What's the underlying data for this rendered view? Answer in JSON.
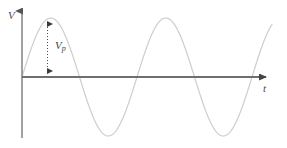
{
  "figure": {
    "background_color": "#ffffff",
    "width": 287,
    "height": 148
  },
  "axes": {
    "y_axis": {
      "label": "V",
      "name": "voltage",
      "color": "#808080",
      "origin_x": 22,
      "top_y": 8,
      "bottom_y": 138,
      "arrow": "up"
    },
    "x_axis": {
      "label": "t",
      "name": "time",
      "color": "#808080",
      "origin_y": 77,
      "left_x": 22,
      "right_x": 272,
      "arrow": "right"
    }
  },
  "annotation": {
    "label_main": "V",
    "label_sub": "p",
    "full_label": "Vp",
    "meaning": "peak voltage",
    "line_style": "dotted",
    "line_color": "#555555",
    "arrow_heads": "both",
    "x": 47.5,
    "y_top": 18,
    "y_bottom": 77
  },
  "chart_data": {
    "type": "line",
    "xlabel": "t",
    "ylabel": "V",
    "grid": false,
    "legend": null,
    "curve_color": "#cdcdcd",
    "waveform": "sine",
    "amplitude_px": 59,
    "period_px": 115,
    "cycles": 2.2,
    "series": [
      {
        "name": "v(t)",
        "expression": "Vp * sin(2*pi*t/T)",
        "x": [
          22,
          29,
          36,
          43,
          50,
          58,
          65,
          72,
          80,
          87,
          94,
          101,
          108,
          116,
          123,
          130,
          137,
          144,
          151,
          158,
          165,
          173,
          180,
          187,
          194,
          201,
          208,
          215,
          222,
          230,
          237,
          244,
          251,
          258,
          265,
          272
        ],
        "y": [
          77,
          57,
          39,
          26,
          18,
          18,
          26,
          39,
          77,
          96,
          114,
          127,
          135,
          135,
          127,
          114,
          77,
          57,
          39,
          26,
          18,
          18,
          26,
          39,
          77,
          96,
          114,
          127,
          135,
          135,
          127,
          114,
          77,
          65,
          57,
          50
        ]
      }
    ],
    "key_points": [
      {
        "name": "origin",
        "x": 22,
        "y": 77
      },
      {
        "name": "first-peak",
        "x": 50,
        "y": 18
      },
      {
        "name": "first-zero-crossing",
        "x": 80,
        "y": 77
      },
      {
        "name": "first-trough",
        "x": 108,
        "y": 135
      },
      {
        "name": "second-zero-crossing",
        "x": 137,
        "y": 77
      },
      {
        "name": "second-peak",
        "x": 165,
        "y": 18
      },
      {
        "name": "third-zero-crossing",
        "x": 194,
        "y": 77
      },
      {
        "name": "second-trough",
        "x": 222,
        "y": 135
      },
      {
        "name": "fourth-zero-crossing",
        "x": 251,
        "y": 77
      }
    ]
  }
}
